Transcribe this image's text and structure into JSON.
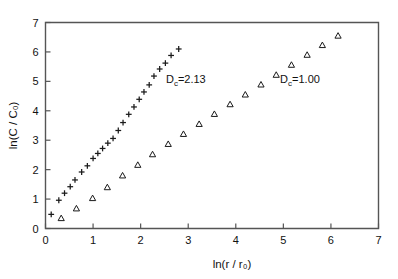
{
  "chart_data": {
    "type": "scatter",
    "title": "",
    "xlabel": "ln(r / r₀)",
    "ylabel": "ln(C / C₀)",
    "xlim": [
      0,
      7
    ],
    "ylim": [
      0,
      7
    ],
    "xticks": [
      0,
      1,
      2,
      3,
      4,
      5,
      6,
      7
    ],
    "yticks": [
      0,
      1,
      2,
      3,
      4,
      5,
      6,
      7
    ],
    "xtick_labels": [
      "0",
      "1",
      "2",
      "3",
      "4",
      "5",
      "6",
      "7"
    ],
    "ytick_labels": [
      "0",
      "1",
      "2",
      "3",
      "4",
      "5",
      "6",
      "7"
    ],
    "grid": false,
    "legend_position": "none",
    "marker_color": "#1a1a1a",
    "axis_color": "#555555",
    "background_color": "#ffffff",
    "series": [
      {
        "name": "Dc=2.13",
        "marker": "plus",
        "slope": 2.13,
        "points": [
          [
            0.12,
            0.48
          ],
          [
            0.28,
            0.96
          ],
          [
            0.4,
            1.2
          ],
          [
            0.52,
            1.42
          ],
          [
            0.62,
            1.65
          ],
          [
            0.76,
            1.92
          ],
          [
            0.88,
            2.13
          ],
          [
            1.0,
            2.38
          ],
          [
            1.1,
            2.55
          ],
          [
            1.2,
            2.72
          ],
          [
            1.31,
            2.9
          ],
          [
            1.42,
            3.06
          ],
          [
            1.53,
            3.33
          ],
          [
            1.63,
            3.6
          ],
          [
            1.75,
            3.88
          ],
          [
            1.86,
            4.13
          ],
          [
            1.97,
            4.39
          ],
          [
            2.07,
            4.64
          ],
          [
            2.18,
            4.88
          ],
          [
            2.28,
            5.18
          ],
          [
            2.4,
            5.42
          ],
          [
            2.52,
            5.62
          ],
          [
            2.64,
            5.88
          ],
          [
            2.8,
            6.1
          ]
        ]
      },
      {
        "name": "Dc=1.00",
        "marker": "triangle",
        "slope": 1.0,
        "points": [
          [
            0.33,
            0.35
          ],
          [
            0.65,
            0.68
          ],
          [
            0.99,
            1.03
          ],
          [
            1.3,
            1.4
          ],
          [
            1.62,
            1.8
          ],
          [
            1.94,
            2.16
          ],
          [
            2.25,
            2.52
          ],
          [
            2.58,
            2.87
          ],
          [
            2.9,
            3.21
          ],
          [
            3.23,
            3.55
          ],
          [
            3.55,
            3.89
          ],
          [
            3.88,
            4.22
          ],
          [
            4.2,
            4.55
          ],
          [
            4.53,
            4.89
          ],
          [
            4.85,
            5.22
          ],
          [
            5.17,
            5.56
          ],
          [
            5.5,
            5.9
          ],
          [
            5.82,
            6.23
          ],
          [
            6.15,
            6.55
          ]
        ]
      }
    ],
    "annotations": [
      {
        "text": "Dᴄ=2.13",
        "label": "Dc=2.13",
        "x": 2.95,
        "y": 4.93
      },
      {
        "text": "Dᴄ=1.00",
        "label": "Dc=1.00",
        "x": 5.35,
        "y": 4.93
      }
    ]
  },
  "annotation_parts": {
    "d_symbol": "D",
    "subscript_c": "c",
    "eq_value_1": "=2.13",
    "eq_value_2": "=1.00"
  }
}
